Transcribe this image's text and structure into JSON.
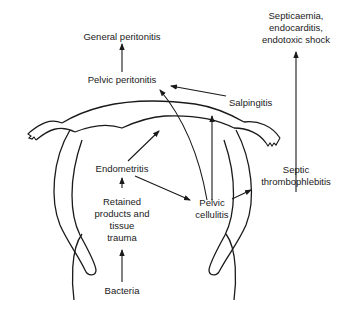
{
  "diagram": {
    "type": "flow-anatomical",
    "nodes": {
      "general_peritonitis": "General peritonitis",
      "pelvic_peritonitis": "Pelvic peritonitis",
      "salpingitis": "Salpingitis",
      "septicaemia_line1": "Septicaemia,",
      "septicaemia_line2": "endocarditis,",
      "septicaemia_line3": "endotoxic shock",
      "endometritis": "Endometritis",
      "retained_line1": "Retained",
      "retained_line2": "products and",
      "retained_line3": "tissue",
      "retained_line4": "trauma",
      "pelvic_cellulitis_line1": "Pelvic",
      "pelvic_cellulitis_line2": "cellulitis",
      "septic_line1": "Septic",
      "septic_line2": "thrombophlebitis",
      "bacteria": "Bacteria"
    },
    "edges": [
      {
        "from": "Bacteria",
        "to": "Retained products and tissue trauma"
      },
      {
        "from": "Retained products and tissue trauma",
        "to": "Endometritis"
      },
      {
        "from": "Endometritis",
        "to": "Salpingitis (uterine horn)"
      },
      {
        "from": "Endometritis",
        "to": "Pelvic cellulitis"
      },
      {
        "from": "Pelvic cellulitis",
        "to": "Pelvic peritonitis"
      },
      {
        "from": "Pelvic cellulitis",
        "to": "Salpingitis"
      },
      {
        "from": "Pelvic cellulitis",
        "to": "Septic thrombophlebitis"
      },
      {
        "from": "Salpingitis",
        "to": "Pelvic peritonitis"
      },
      {
        "from": "Pelvic peritonitis",
        "to": "General peritonitis"
      },
      {
        "from": "Septic thrombophlebitis",
        "to": "Septicaemia, endocarditis, endotoxic shock"
      }
    ]
  }
}
